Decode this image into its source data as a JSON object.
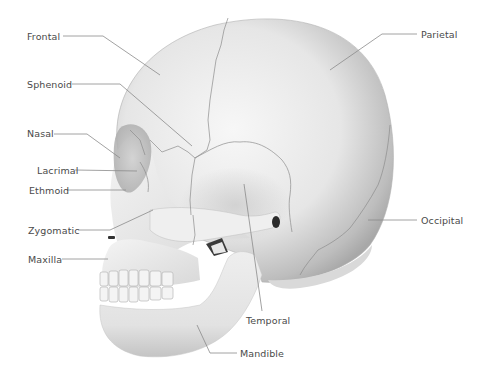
{
  "diagram": {
    "colors": {
      "background": "#ffffff",
      "bone_light": "#f2f2f2",
      "bone_shadow": "#b8b8b8",
      "label_text": "#4a4a4a",
      "leader_line": "#8a8a8a",
      "suture": "#8c8c8c"
    },
    "labels": [
      {
        "id": "frontal",
        "text": "Frontal",
        "x": 27,
        "y": 31
      },
      {
        "id": "sphenoid",
        "text": "Sphenoid",
        "x": 27,
        "y": 79
      },
      {
        "id": "nasal",
        "text": "Nasal",
        "x": 27,
        "y": 128
      },
      {
        "id": "lacrimal",
        "text": "Lacrimal",
        "x": 37,
        "y": 165
      },
      {
        "id": "ethmoid",
        "text": "Ethmoid",
        "x": 29,
        "y": 185
      },
      {
        "id": "zygomatic",
        "text": "Zygomatic",
        "x": 28,
        "y": 225
      },
      {
        "id": "maxilla",
        "text": "Maxilla",
        "x": 28,
        "y": 254
      },
      {
        "id": "parietal",
        "text": "Parietal",
        "x": 421,
        "y": 29
      },
      {
        "id": "occipital",
        "text": "Occipital",
        "x": 421,
        "y": 215
      },
      {
        "id": "temporal",
        "text": "Temporal",
        "x": 246,
        "y": 315
      },
      {
        "id": "mandible",
        "text": "Mandible",
        "x": 240,
        "y": 348
      }
    ]
  }
}
